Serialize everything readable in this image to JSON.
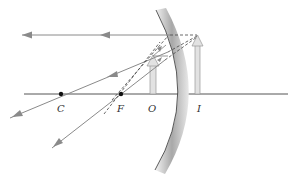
{
  "diagram": {
    "labels": {
      "center": "C",
      "focal_point": "F",
      "object": "O",
      "image": "I"
    },
    "colors": {
      "background": "#ffffff",
      "ray": "#8a8a8a",
      "axis": "#555555",
      "dashed": "#444444",
      "arrow_fill": "#e2e2e2",
      "arrow_stroke": "#999999",
      "mirror_dark": "#8c8c8c",
      "mirror_light": "#f2f2f2",
      "point": "#111111"
    }
  }
}
